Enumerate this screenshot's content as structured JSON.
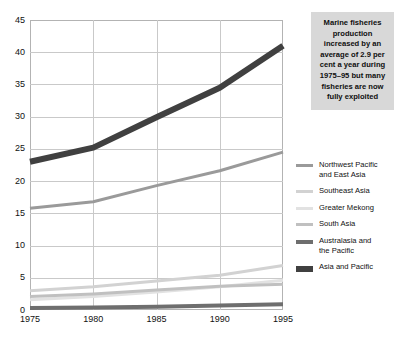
{
  "callout": {
    "text": "Marine fisheries production increased by an average of 2.9 per cent a year during 1975–95 but many fisheries are now fully exploited"
  },
  "legend": {
    "items": [
      {
        "label": "Northwest Pacific\nand East Asia",
        "color": "#9a9a9a",
        "width": 3
      },
      {
        "label": "Southeast Asia",
        "color": "#d2d2d2",
        "width": 3
      },
      {
        "label": "Greater Mekong",
        "color": "#e2e2e2",
        "width": 3
      },
      {
        "label": "South Asia",
        "color": "#c0c0c0",
        "width": 3
      },
      {
        "label": "Australasia and\nthe Pacific",
        "color": "#6e6e6e",
        "width": 4
      },
      {
        "label": "Asia and Pacific",
        "color": "#404040",
        "width": 6
      }
    ]
  },
  "chart_data": {
    "type": "line",
    "title": "",
    "xlabel": "",
    "ylabel": "",
    "x": [
      1975,
      1980,
      1985,
      1990,
      1995
    ],
    "xticklabels": [
      "1975",
      "1980",
      "1985",
      "1990",
      "1995"
    ],
    "yticks": [
      0,
      5,
      10,
      15,
      20,
      25,
      30,
      35,
      40,
      45
    ],
    "yticklabels": [
      "0",
      "5",
      "10",
      "15",
      "20",
      "25",
      "30",
      "35",
      "40",
      "45"
    ],
    "ylim": [
      0,
      45
    ],
    "xlim": [
      1975,
      1995
    ],
    "grid": true,
    "legend_position": "right",
    "series": [
      {
        "name": "Asia and Pacific",
        "color": "#404040",
        "width": 6,
        "values": [
          23.0,
          25.2,
          29.9,
          34.5,
          41.0
        ]
      },
      {
        "name": "Northwest Pacific and East Asia",
        "color": "#9a9a9a",
        "width": 3,
        "values": [
          15.8,
          16.8,
          19.3,
          21.6,
          24.5
        ]
      },
      {
        "name": "Southeast Asia",
        "color": "#d2d2d2",
        "width": 3,
        "values": [
          3.0,
          3.6,
          4.5,
          5.4,
          6.9
        ]
      },
      {
        "name": "Greater Mekong",
        "color": "#e2e2e2",
        "width": 3,
        "values": [
          1.6,
          2.1,
          2.8,
          3.6,
          4.6
        ]
      },
      {
        "name": "South Asia",
        "color": "#c0c0c0",
        "width": 3,
        "values": [
          2.1,
          2.5,
          3.1,
          3.7,
          4.0
        ]
      },
      {
        "name": "Australasia and the Pacific",
        "color": "#6e6e6e",
        "width": 4,
        "values": [
          0.3,
          0.4,
          0.5,
          0.7,
          0.9
        ]
      }
    ]
  }
}
